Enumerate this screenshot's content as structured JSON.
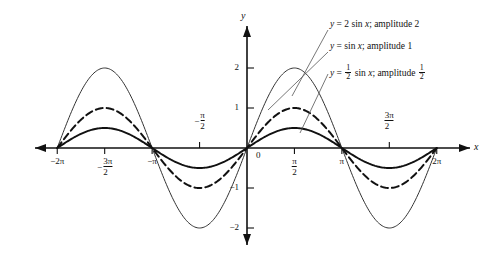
{
  "figure": {
    "axis_x_label": "x",
    "axis_y_label": "y",
    "origin_label": "0"
  },
  "legend": [
    {
      "id": "curve-amp-2",
      "prefix": "y = 2 sin x; amplitude 2",
      "eq_lhs": "y",
      "eq_rhs": "2 sin x",
      "amplitude_text": "amplitude 2"
    },
    {
      "id": "curve-amp-1",
      "prefix": "y = sin x; amplitude 1",
      "eq_lhs": "y",
      "eq_rhs": "sin x",
      "amplitude_text": "amplitude 1"
    },
    {
      "id": "curve-amp-half",
      "prefix": "y = 1/2 sin x; amplitude 1/2",
      "eq_lhs": "y",
      "eq_rhs": "sin x",
      "amplitude_text": "amplitude"
    }
  ],
  "ticks": {
    "x": [
      {
        "label": "-2π",
        "value": -6.2832,
        "position": "below"
      },
      {
        "label": "-3π/2",
        "value": -4.7124,
        "position": "below"
      },
      {
        "label": "-π",
        "value": -3.1416,
        "position": "below"
      },
      {
        "label": "-π/2",
        "value": -1.5708,
        "position": "above"
      },
      {
        "label": "π/2",
        "value": 1.5708,
        "position": "below"
      },
      {
        "label": "π",
        "value": 3.1416,
        "position": "below"
      },
      {
        "label": "3π/2",
        "value": 4.7124,
        "position": "above"
      },
      {
        "label": "2π",
        "value": 6.2832,
        "position": "below"
      }
    ],
    "y": [
      {
        "label": "2",
        "value": 2
      },
      {
        "label": "1",
        "value": 1
      },
      {
        "label": "-1",
        "value": -1
      },
      {
        "label": "-2",
        "value": -2
      }
    ]
  },
  "chart_data": {
    "type": "line",
    "title": "",
    "xlabel": "x",
    "ylabel": "y",
    "xlim": [
      -7.2,
      7.2
    ],
    "ylim": [
      -2.6,
      2.6
    ],
    "grid": false,
    "legend_position": "top-right",
    "x_tick_values": [
      -6.2832,
      -4.7124,
      -3.1416,
      -1.5708,
      1.5708,
      3.1416,
      4.7124,
      6.2832
    ],
    "x_tick_labels": [
      "-2π",
      "-3π/2",
      "-π",
      "-π/2",
      "π/2",
      "π",
      "3π/2",
      "2π"
    ],
    "y_tick_values": [
      2,
      1,
      -1,
      -2
    ],
    "y_tick_labels": [
      "2",
      "1",
      "-1",
      "-2"
    ],
    "series": [
      {
        "name": "y = 2 sin x; amplitude 2",
        "amplitude": 2,
        "style": "thin-solid",
        "color": "#333333",
        "x": [
          -6.2832,
          -5.8905,
          -5.4978,
          -5.1051,
          -4.7124,
          -4.3197,
          -3.927,
          -3.5343,
          -3.1416,
          -2.7489,
          -2.3562,
          -1.9635,
          -1.5708,
          -1.1781,
          -0.7854,
          -0.3927,
          0,
          0.3927,
          0.7854,
          1.1781,
          1.5708,
          1.9635,
          2.3562,
          2.7489,
          3.1416,
          3.5343,
          3.927,
          4.3197,
          4.7124,
          5.1051,
          5.4978,
          5.8905,
          6.2832
        ],
        "y": [
          0,
          0.7654,
          1.4142,
          1.8478,
          2,
          1.8478,
          1.4142,
          0.7654,
          0,
          -0.7654,
          -1.4142,
          -1.8478,
          -2,
          -1.8478,
          -1.4142,
          -0.7654,
          0,
          0.7654,
          1.4142,
          1.8478,
          2,
          1.8478,
          1.4142,
          0.7654,
          0,
          -0.7654,
          -1.4142,
          -1.8478,
          -2,
          -1.8478,
          -1.4142,
          -0.7654,
          0
        ]
      },
      {
        "name": "y = sin x; amplitude 1",
        "amplitude": 1,
        "style": "dashed",
        "color": "#111111",
        "x": [
          -6.2832,
          -5.8905,
          -5.4978,
          -5.1051,
          -4.7124,
          -4.3197,
          -3.927,
          -3.5343,
          -3.1416,
          -2.7489,
          -2.3562,
          -1.9635,
          -1.5708,
          -1.1781,
          -0.7854,
          -0.3927,
          0,
          0.3927,
          0.7854,
          1.1781,
          1.5708,
          1.9635,
          2.3562,
          2.7489,
          3.1416,
          3.5343,
          3.927,
          4.3197,
          4.7124,
          5.1051,
          5.4978,
          5.8905,
          6.2832
        ],
        "y": [
          0,
          0.3827,
          0.7071,
          0.9239,
          1,
          0.9239,
          0.7071,
          0.3827,
          0,
          -0.3827,
          -0.7071,
          -0.9239,
          -1,
          -0.9239,
          -0.7071,
          -0.3827,
          0,
          0.3827,
          0.7071,
          0.9239,
          1,
          0.9239,
          0.7071,
          0.3827,
          0,
          -0.3827,
          -0.7071,
          -0.9239,
          -1,
          -0.9239,
          -0.7071,
          -0.3827,
          0
        ]
      },
      {
        "name": "y = 1/2 sin x; amplitude 1/2",
        "amplitude": 0.5,
        "style": "thick-solid",
        "color": "#111111",
        "x": [
          -6.2832,
          -5.8905,
          -5.4978,
          -5.1051,
          -4.7124,
          -4.3197,
          -3.927,
          -3.5343,
          -3.1416,
          -2.7489,
          -2.3562,
          -1.9635,
          -1.5708,
          -1.1781,
          -0.7854,
          -0.3927,
          0,
          0.3927,
          0.7854,
          1.1781,
          1.5708,
          1.9635,
          2.3562,
          2.7489,
          3.1416,
          3.5343,
          3.927,
          4.3197,
          4.7124,
          5.1051,
          5.4978,
          5.8905,
          6.2832
        ],
        "y": [
          0,
          0.1913,
          0.3536,
          0.4619,
          0.5,
          0.4619,
          0.3536,
          0.1913,
          0,
          -0.1913,
          -0.3536,
          -0.4619,
          -0.5,
          -0.4619,
          -0.3536,
          -0.1913,
          0,
          0.1913,
          0.3536,
          0.4619,
          0.5,
          0.4619,
          0.3536,
          0.1913,
          0,
          -0.1913,
          -0.3536,
          -0.4619,
          -0.5,
          -0.4619,
          -0.3536,
          -0.1913,
          0
        ]
      }
    ]
  }
}
